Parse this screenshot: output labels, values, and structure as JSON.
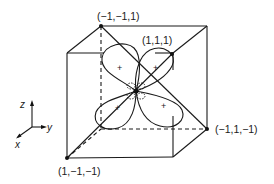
{
  "diagram": {
    "vertex_labels": {
      "top_back_left": "(−1,−1,1)",
      "top_right_diag": "(1,1,1)",
      "bottom_back_right": "(−1,1,−1)",
      "bottom_front_left": "(1,−1,−1)"
    },
    "axes": {
      "z": "z",
      "y": "y",
      "x": "x"
    },
    "lobe_signs": [
      "+",
      "+",
      "+",
      "+"
    ],
    "colors": {
      "line": "#1a1a1a",
      "background": "#ffffff"
    }
  }
}
